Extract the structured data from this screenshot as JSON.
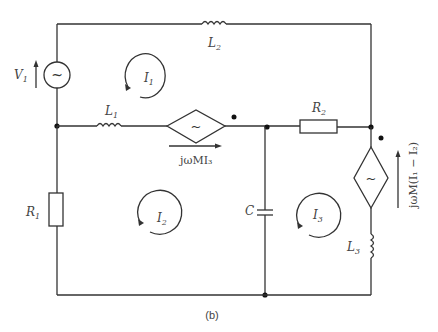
{
  "caption": "(b)",
  "components": {
    "V1": {
      "name": "V",
      "sub": "1"
    },
    "L1": {
      "name": "L",
      "sub": "1"
    },
    "L2": {
      "name": "L",
      "sub": "2"
    },
    "L3": {
      "name": "L",
      "sub": "3"
    },
    "R1": {
      "name": "R",
      "sub": "1"
    },
    "R2": {
      "name": "R",
      "sub": "2"
    },
    "C": {
      "name": "C"
    }
  },
  "loops": {
    "I1": {
      "name": "I",
      "sub": "1"
    },
    "I2": {
      "name": "I",
      "sub": "2"
    },
    "I3": {
      "name": "I",
      "sub": "3"
    }
  },
  "sources": {
    "dep_source_1_label": "jωMI₃",
    "dep_source_2_label": "jωM(I₁ − I₂)",
    "source_glyph": "~"
  }
}
